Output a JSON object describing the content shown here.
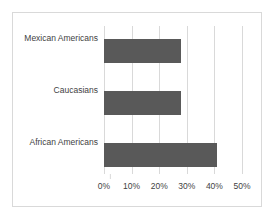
{
  "chart_data": {
    "type": "bar",
    "orientation": "horizontal",
    "title": "",
    "subtitle": "",
    "xlabel": "",
    "ylabel": "",
    "categories": [
      "Mexican Americans",
      "Caucasians",
      "African Americans"
    ],
    "values": [
      28,
      28,
      41
    ],
    "value_suffix": "%",
    "xlim": [
      0,
      50
    ],
    "xticks": [
      0,
      10,
      20,
      30,
      40,
      50
    ],
    "xtick_labels": [
      "0%",
      "10%",
      "20%",
      "30%",
      "40%",
      "50%"
    ],
    "grid": true,
    "grid_axis": "x",
    "legend": false,
    "legend_position": "none",
    "series": [
      {
        "name": "",
        "values": [
          28,
          28,
          41
        ]
      }
    ],
    "colors": {
      "bar_fill": "#595959",
      "gridline": "#d9d9d9",
      "frame_border": "#d9d9d9",
      "text": "#3f3f3f",
      "background": "#ffffff"
    }
  }
}
